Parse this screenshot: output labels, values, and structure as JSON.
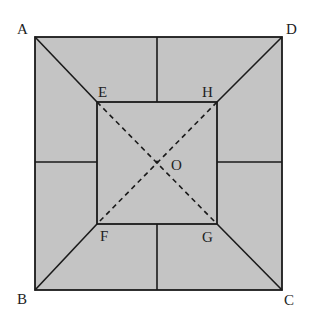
{
  "diagram": {
    "colors": {
      "fill": "#c4c4c4",
      "stroke": "#1a1a1a"
    },
    "outer_square": {
      "A": [
        35,
        37
      ],
      "D": [
        282,
        37
      ],
      "C": [
        282,
        290
      ],
      "B": [
        35,
        290
      ]
    },
    "inner_square": {
      "E": [
        97,
        102
      ],
      "H": [
        217,
        102
      ],
      "G": [
        217,
        224
      ],
      "F": [
        97,
        224
      ]
    },
    "center": {
      "O": [
        157,
        162
      ]
    },
    "labels": {
      "A": "A",
      "B": "B",
      "C": "C",
      "D": "D",
      "E": "E",
      "F": "F",
      "G": "G",
      "H": "H",
      "O": "O"
    }
  }
}
